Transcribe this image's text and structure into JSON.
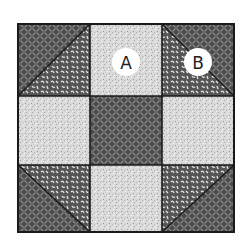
{
  "diagram": {
    "type": "quilt-block",
    "grid": {
      "rows": 3,
      "cols": 3
    },
    "colors": {
      "dark_fabric": "#4a4a4a",
      "dark_pattern": "#8a8a8a",
      "light_fabric": "#d6d6d6",
      "medium_fabric": "#5a5a5a",
      "medium_pattern": "#e6e6e6",
      "outline": "#1a1a1a",
      "label_circle": "#ffffff"
    },
    "labels": [
      {
        "text": "A",
        "piece": "light square"
      },
      {
        "text": "B",
        "piece": "half-square triangle"
      }
    ]
  }
}
